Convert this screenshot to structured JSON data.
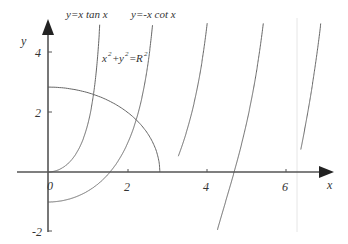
{
  "chart_data": {
    "type": "line",
    "title": "",
    "xlabel": "x",
    "ylabel": "y",
    "xlim": [
      -0.8,
      7.1
    ],
    "ylim": [
      -2,
      5
    ],
    "x_ticks": [
      0,
      2,
      4,
      6
    ],
    "x_tick_labels": [
      "0",
      "2",
      "4",
      "6"
    ],
    "y_ticks": [
      -2,
      2,
      4
    ],
    "y_tick_labels": [
      "-2",
      "2",
      "4"
    ],
    "grid": false,
    "legend": "none",
    "annotations": [
      {
        "text": "y=x tan x",
        "x": 0.8,
        "y": 5.3
      },
      {
        "text": "y=-x cot x",
        "x": 2.1,
        "y": 5.3
      },
      {
        "text": "x²+y²=R²",
        "x": 1.4,
        "y": 3.9
      }
    ],
    "series": [
      {
        "name": "y=x tan x",
        "function": "x*tan(x)",
        "branches": [
          [
            0,
            1.33
          ],
          [
            3.3,
            4.35
          ],
          [
            6.4,
            7.05
          ]
        ]
      },
      {
        "name": "y=-x cot x",
        "function": "-x/tan(x)",
        "branches": [
          [
            0.001,
            2.65
          ],
          [
            3.3,
            5.7
          ]
        ]
      },
      {
        "name": "x^2+y^2=R^2",
        "function": "circle",
        "R": 2.83,
        "range_deg": [
          0,
          90
        ]
      }
    ]
  },
  "labels": {
    "tan_curve": "y=x tan x",
    "cot_curve": "y=-x cot x",
    "circle_x": "x",
    "circle_y": "y",
    "circle_R": "R",
    "sup2": "2",
    "eq": "=",
    "plus": "+",
    "x_axis": "x",
    "y_axis": "y",
    "tick_0": "0",
    "tick_x2": "2",
    "tick_x4": "4",
    "tick_x6": "6",
    "tick_y2": "2",
    "tick_y4": "4",
    "tick_ym2": "-2"
  }
}
